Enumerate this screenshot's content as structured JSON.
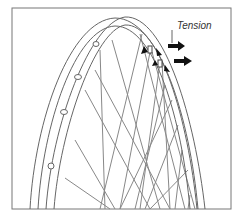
{
  "figure": {
    "label": "Tension",
    "colors": {
      "line": "#666666",
      "spoke": "#888888",
      "arrow": "#111111",
      "frame": "#777777",
      "background": "#ffffff"
    }
  }
}
